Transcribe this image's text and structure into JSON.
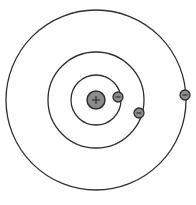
{
  "diagram": {
    "type": "bohr-atom-model",
    "center": [
      96,
      100
    ],
    "nucleus": {
      "radius": 9,
      "sign": "+",
      "fill": "#8c8c8c",
      "stroke": "#2e2e2e"
    },
    "orbits": [
      {
        "name": "inner-shell",
        "radius": 25,
        "electrons": [
          {
            "x": 118,
            "y": 97,
            "sign": "−"
          }
        ]
      },
      {
        "name": "middle-shell",
        "radius": 48,
        "electrons": [
          {
            "x": 139,
            "y": 113,
            "sign": "−"
          }
        ]
      },
      {
        "name": "outer-shell",
        "radius": 90,
        "electrons": [
          {
            "x": 185,
            "y": 95,
            "sign": "−"
          }
        ]
      }
    ],
    "electron": {
      "radius": 5,
      "fill": "#8c8c8c",
      "stroke": "#2e2e2e"
    },
    "line_color": "#2e2e2e"
  }
}
